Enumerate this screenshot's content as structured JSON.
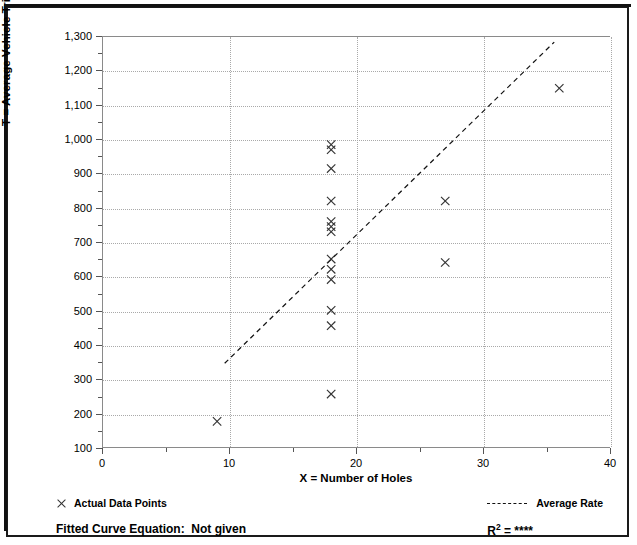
{
  "chart_data": {
    "type": "scatter",
    "title": "",
    "xlabel": "X = Number of Holes",
    "ylabel": "T = Average Vehicle Trip Ends",
    "xlim": [
      0,
      40
    ],
    "ylim": [
      100,
      1300
    ],
    "xticks": [
      0,
      10,
      20,
      30,
      40
    ],
    "yticks": [
      100,
      200,
      300,
      400,
      500,
      600,
      700,
      800,
      900,
      1000,
      1100,
      1200,
      1300
    ],
    "ytick_labels": [
      "100",
      "200",
      "300",
      "400",
      "500",
      "600",
      "700",
      "800",
      "900",
      "1,000",
      "1,100",
      "1,200",
      "1,300"
    ],
    "xtick_labels": [
      "0",
      "10",
      "20",
      "30",
      "40"
    ],
    "grid": true,
    "grid_style": "dotted",
    "legend_position": "below-axes",
    "series": [
      {
        "name": "Actual Data Points",
        "type": "scatter",
        "marker": "x",
        "color": "#333333",
        "points": [
          {
            "x": 9,
            "y": 175
          },
          {
            "x": 18,
            "y": 255
          },
          {
            "x": 18,
            "y": 455
          },
          {
            "x": 18,
            "y": 500
          },
          {
            "x": 18,
            "y": 590
          },
          {
            "x": 18,
            "y": 620
          },
          {
            "x": 18,
            "y": 650
          },
          {
            "x": 18,
            "y": 730
          },
          {
            "x": 18,
            "y": 745
          },
          {
            "x": 18,
            "y": 760
          },
          {
            "x": 18,
            "y": 820
          },
          {
            "x": 18,
            "y": 915
          },
          {
            "x": 18,
            "y": 970
          },
          {
            "x": 18,
            "y": 985
          },
          {
            "x": 27,
            "y": 640
          },
          {
            "x": 27,
            "y": 820
          },
          {
            "x": 36,
            "y": 1150
          }
        ]
      },
      {
        "name": "Average Rate",
        "type": "line",
        "style": "dashed",
        "color": "#111111",
        "endpoints": [
          {
            "x": 9.6,
            "y": 345
          },
          {
            "x": 35.6,
            "y": 1285
          }
        ]
      }
    ],
    "annotations": {
      "fitted_curve_equation": "Fitted Curve Equation:  Not given",
      "r_squared_label": "R",
      "r_squared_exponent": "2",
      "r_squared_value": "= ****"
    }
  },
  "legend": {
    "actual_points_label": "Actual Data Points",
    "average_rate_label": "Average Rate",
    "marker_icon": "x-marker-icon",
    "line_icon": "dashed-line-icon"
  },
  "footer": {
    "fitted_curve_equation": "Fitted Curve Equation:  Not given",
    "r_squared_base": "R",
    "r_squared_sup": "2",
    "r_squared_rest": " = ****"
  },
  "colors": {
    "frame": "#1a1a1a",
    "axis": "#8a8a8a",
    "grid": "#a9a9a9",
    "marker": "#333333",
    "trendline": "#111111",
    "text": "#000000",
    "background": "#ffffff"
  }
}
